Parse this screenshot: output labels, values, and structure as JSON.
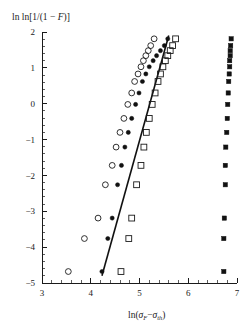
{
  "chart_data": {
    "type": "scatter",
    "title": "",
    "subtitle": "",
    "xlabel": "ln(σ_F − σ_th)",
    "ylabel": "ln ln[1/(1 − F)]",
    "xlabel_parts": {
      "prefix": "ln(",
      "sym1": "σ",
      "sub1": "F",
      "minus": "−",
      "sym2": "σ",
      "sub2": "th",
      "suffix": ")"
    },
    "ylabel_parts": {
      "lead": "ln ln[1/(1 − ",
      "italic": "F",
      "tail": ")]"
    },
    "xlim": [
      3,
      7
    ],
    "ylim": [
      -5,
      2
    ],
    "xticks": [
      3,
      4,
      5,
      6,
      7
    ],
    "yticks": [
      2,
      1,
      0,
      -1,
      -2,
      -3,
      -4,
      -5
    ],
    "xtick_labels": [
      "3",
      "4",
      "5",
      "6",
      "7"
    ],
    "ytick_labels": [
      "2",
      "1",
      "0",
      "-1",
      "-2",
      "-3",
      "-4",
      "-5"
    ],
    "x_minor_per_major": 4,
    "y_minor_per_major": 4,
    "grid": false,
    "legend": "none",
    "legend_position": "none",
    "series": [
      {
        "name": "open-circles",
        "marker": "open-circle",
        "marker_size": 4.2,
        "points": [
          [
            3.54,
            -4.68
          ],
          [
            3.87,
            -3.76
          ],
          [
            4.15,
            -3.19
          ],
          [
            4.3,
            -2.26
          ],
          [
            4.44,
            -1.72
          ],
          [
            4.52,
            -1.21
          ],
          [
            4.6,
            -0.8
          ],
          [
            4.68,
            -0.41
          ],
          [
            4.76,
            -0.02
          ],
          [
            4.84,
            0.3
          ],
          [
            4.9,
            0.62
          ],
          [
            4.97,
            0.83
          ],
          [
            5.03,
            1.03
          ],
          [
            5.08,
            1.2
          ],
          [
            5.13,
            1.34
          ],
          [
            5.18,
            1.48
          ],
          [
            5.23,
            1.62
          ],
          [
            5.3,
            1.81
          ]
        ]
      },
      {
        "name": "filled-circles",
        "marker": "filled-circle",
        "marker_size": 2.6,
        "points": [
          [
            4.23,
            -4.68
          ],
          [
            4.35,
            -3.76
          ],
          [
            4.44,
            -3.19
          ],
          [
            4.55,
            -2.26
          ],
          [
            4.63,
            -1.72
          ],
          [
            4.7,
            -1.21
          ],
          [
            4.77,
            -0.8
          ],
          [
            4.84,
            -0.41
          ],
          [
            4.92,
            -0.02
          ],
          [
            4.99,
            0.3
          ],
          [
            5.06,
            0.62
          ],
          [
            5.13,
            0.83
          ],
          [
            5.2,
            1.03
          ],
          [
            5.28,
            1.2
          ],
          [
            5.35,
            1.34
          ],
          [
            5.43,
            1.48
          ],
          [
            5.51,
            1.62
          ],
          [
            5.58,
            1.81
          ]
        ]
      },
      {
        "name": "open-squares",
        "marker": "open-square",
        "marker_size": 4.2,
        "points": [
          [
            4.62,
            -4.68
          ],
          [
            4.78,
            -3.76
          ],
          [
            4.84,
            -3.19
          ],
          [
            4.94,
            -2.26
          ],
          [
            5.03,
            -1.72
          ],
          [
            5.09,
            -1.21
          ],
          [
            5.14,
            -0.8
          ],
          [
            5.2,
            -0.41
          ],
          [
            5.26,
            -0.02
          ],
          [
            5.32,
            0.3
          ],
          [
            5.38,
            0.62
          ],
          [
            5.43,
            0.83
          ],
          [
            5.48,
            1.03
          ],
          [
            5.53,
            1.2
          ],
          [
            5.58,
            1.34
          ],
          [
            5.63,
            1.48
          ],
          [
            5.68,
            1.62
          ],
          [
            5.74,
            1.81
          ]
        ]
      },
      {
        "name": "filled-squares",
        "marker": "filled-square",
        "marker_size": 3.4,
        "points": [
          [
            6.73,
            -4.68
          ],
          [
            6.73,
            -3.76
          ],
          [
            6.74,
            -3.19
          ],
          [
            6.76,
            -2.26
          ],
          [
            6.76,
            -1.72
          ],
          [
            6.77,
            -1.21
          ],
          [
            6.79,
            -0.8
          ],
          [
            6.8,
            -0.41
          ],
          [
            6.81,
            -0.02
          ],
          [
            6.82,
            0.3
          ],
          [
            6.83,
            0.62
          ],
          [
            6.84,
            0.83
          ],
          [
            6.85,
            1.03
          ],
          [
            6.85,
            1.2
          ],
          [
            6.86,
            1.34
          ],
          [
            6.86,
            1.48
          ],
          [
            6.87,
            1.62
          ],
          [
            6.88,
            1.81
          ]
        ]
      }
    ],
    "fit_line": {
      "name": "weibull-fit-line",
      "x": [
        4.23,
        5.6
      ],
      "y": [
        -4.8,
        1.9
      ]
    },
    "annotations": []
  }
}
